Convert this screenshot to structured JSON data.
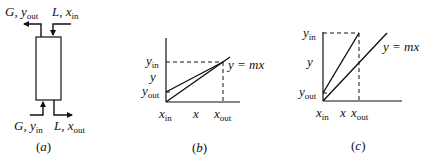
{
  "panel_a": {
    "caption": "a",
    "top_left": {
      "var": "G",
      "sym": "y",
      "sub": "out"
    },
    "top_right": {
      "var": "L",
      "sym": "x",
      "sub": "in"
    },
    "bottom_left": {
      "var": "G",
      "sym": "y",
      "sub": "in"
    },
    "bottom_right": {
      "var": "L",
      "sym": "x",
      "sub": "out"
    }
  },
  "panel_b": {
    "caption": "b",
    "y_axis_label": "y",
    "x_axis_label": "x",
    "y_top_label": {
      "sym": "y",
      "sub": "in"
    },
    "y_bottom_label": {
      "sym": "y",
      "sub": "out"
    },
    "x_left_label": {
      "sym": "x",
      "sub": "in"
    },
    "x_right_label": {
      "sym": "x",
      "sub": "out"
    },
    "equilibrium_label": "y = mx"
  },
  "panel_c": {
    "caption": "c",
    "y_axis_label": "y",
    "x_axis_label": "x",
    "y_top_label": {
      "sym": "y",
      "sub": "in"
    },
    "y_bottom_label": {
      "sym": "y",
      "sub": "out"
    },
    "x_left_label": {
      "sym": "x",
      "sub": "in"
    },
    "x_right_label": {
      "sym": "x",
      "sub": "out"
    },
    "equilibrium_label": "y = mx"
  }
}
